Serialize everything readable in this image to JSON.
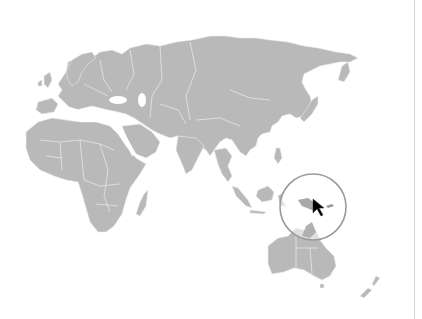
{
  "map": {
    "projection": "world map (Eastern Hemisphere view)",
    "visible_regions": [
      "Europe",
      "Africa",
      "Middle East",
      "Russia",
      "Asia",
      "Southeast Asia",
      "Australia",
      "New Zealand",
      "Madagascar",
      "Japan"
    ],
    "land_color": "#b9b9b9",
    "border_color": "#ececec",
    "background_color": "#ffffff"
  },
  "highlight": {
    "type": "magnifier-circle",
    "region": "Papua New Guinea",
    "center_px": [
      313,
      207
    ],
    "radius_px": 33,
    "stroke_color": "#9a9a9a"
  },
  "cursor": {
    "type": "arrow-pointer",
    "position_px": [
      316,
      202
    ],
    "color": "#000000"
  },
  "divider": {
    "x_px": 414,
    "color": "#d4d4d4"
  }
}
